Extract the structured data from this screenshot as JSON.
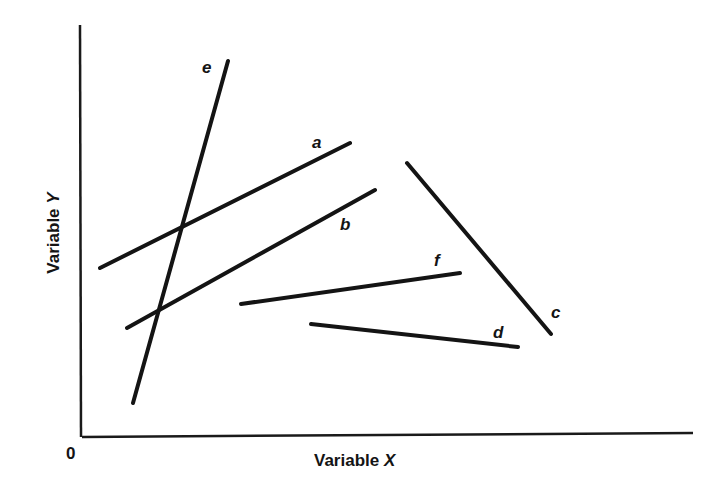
{
  "chart_data": {
    "type": "line",
    "title": "",
    "xlabel": "Variable X",
    "ylabel": "Variable Y",
    "origin_label": "0",
    "grid": false,
    "legend": null,
    "axis_pixels": {
      "y_axis": {
        "x1": 80,
        "y1": 25,
        "x2": 81,
        "y2": 437
      },
      "x_axis": {
        "x1": 82,
        "y1": 437,
        "x2": 693,
        "y2": 433
      }
    },
    "series": [
      {
        "name": "a",
        "label": "a",
        "points": [
          [
            100,
            268
          ],
          [
            350,
            143
          ]
        ],
        "label_pos": [
          312,
          148
        ]
      },
      {
        "name": "b",
        "label": "b",
        "points": [
          [
            127,
            328
          ],
          [
            375,
            190
          ]
        ],
        "label_pos": [
          340,
          230
        ]
      },
      {
        "name": "c",
        "label": "c",
        "points": [
          [
            407,
            163
          ],
          [
            551,
            334
          ]
        ],
        "label_pos": [
          551,
          318
        ]
      },
      {
        "name": "d",
        "label": "d",
        "points": [
          [
            311,
            324
          ],
          [
            518,
            347
          ]
        ],
        "label_pos": [
          493,
          338
        ]
      },
      {
        "name": "e",
        "label": "e",
        "points": [
          [
            133,
            403
          ],
          [
            228,
            61
          ]
        ],
        "label_pos": [
          202,
          73
        ]
      },
      {
        "name": "f",
        "label": "f",
        "points": [
          [
            241,
            304
          ],
          [
            460,
            273
          ]
        ],
        "label_pos": [
          434,
          266
        ]
      }
    ]
  }
}
